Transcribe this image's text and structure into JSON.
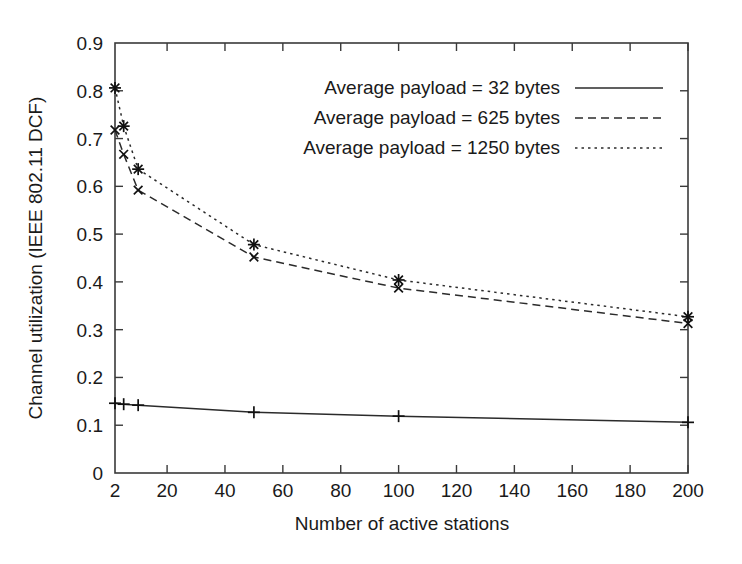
{
  "chart_data": {
    "type": "line",
    "title": "",
    "xlabel": "Number of active stations",
    "ylabel": "Channel utilization (IEEE 802.11 DCF)",
    "xlim": [
      2,
      200
    ],
    "ylim": [
      0,
      0.9
    ],
    "grid": false,
    "legend_position": "top-right",
    "xticks": [
      2,
      20,
      40,
      60,
      80,
      100,
      120,
      140,
      160,
      180,
      200
    ],
    "xtick_labels": [
      "2",
      "20",
      "40",
      "60",
      "80",
      "100",
      "120",
      "140",
      "160",
      "180",
      "200"
    ],
    "yticks": [
      0,
      0.1,
      0.2,
      0.3,
      0.4,
      0.5,
      0.6,
      0.7,
      0.8,
      0.9
    ],
    "ytick_labels": [
      "0",
      "0.1",
      "0.2",
      "0.3",
      "0.4",
      "0.5",
      "0.6",
      "0.7",
      "0.8",
      "0.9"
    ],
    "x": [
      2,
      5,
      10,
      50,
      100,
      200
    ],
    "series": [
      {
        "name": "Average payload = 32 bytes",
        "linestyle": "solid",
        "marker": "plus",
        "color": "#2b2b2b",
        "values": [
          0.146,
          0.144,
          0.142,
          0.127,
          0.119,
          0.106
        ]
      },
      {
        "name": "Average payload = 625 bytes",
        "linestyle": "dashed",
        "marker": "cross",
        "color": "#2b2b2b",
        "values": [
          0.718,
          0.667,
          0.592,
          0.452,
          0.387,
          0.313
        ]
      },
      {
        "name": "Average payload = 1250 bytes",
        "linestyle": "dotted",
        "marker": "star",
        "color": "#2b2b2b",
        "values": [
          0.806,
          0.726,
          0.636,
          0.478,
          0.404,
          0.327
        ]
      }
    ]
  },
  "legend": {
    "entries": [
      {
        "label": "Average payload = 32 bytes",
        "style": "solid"
      },
      {
        "label": "Average payload = 625 bytes",
        "style": "dashed"
      },
      {
        "label": "Average payload = 1250 bytes",
        "style": "dotted"
      }
    ]
  },
  "axes": {
    "x_title": "Number of active stations",
    "y_title": "Channel utilization (IEEE 802.11 DCF)"
  }
}
